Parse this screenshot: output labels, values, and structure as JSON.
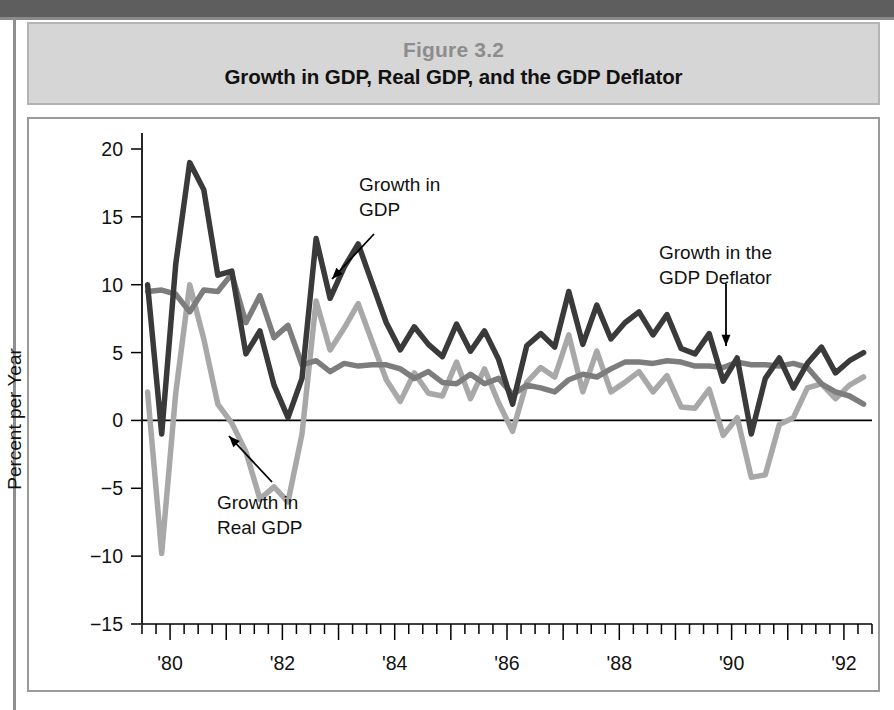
{
  "figure": {
    "number_label": "Figure 3.2",
    "title": "Growth in GDP, Real GDP, and the GDP Deflator"
  },
  "chart_data": {
    "type": "line",
    "title": "Growth in GDP, Real GDP, and the GDP Deflator",
    "xlabel": "",
    "ylabel": "Percent per Year",
    "ylim": [
      -15,
      20
    ],
    "xlim": [
      1979.5,
      1992.5
    ],
    "yticks": [
      20,
      15,
      10,
      5,
      0,
      -5,
      -10,
      -15
    ],
    "ytick_labels": [
      "20",
      "15",
      "10",
      "5",
      "0",
      "−5",
      "−10",
      "−15"
    ],
    "xticks": [
      1980,
      1982,
      1984,
      1986,
      1988,
      1990,
      1992
    ],
    "xtick_labels": [
      "'80",
      "'82",
      "'84",
      "'86",
      "'88",
      "'90",
      "'92"
    ],
    "minor_tick_interval_years": 0.25,
    "grid": false,
    "legend": "annotations",
    "annotations": [
      {
        "name": "growth-in-gdp",
        "text": "Growth in\nGDP",
        "lines": [
          "Growth in",
          "GDP"
        ],
        "series": "Growth in GDP"
      },
      {
        "name": "growth-in-real-gdp",
        "text": "Growth in\nReal GDP",
        "lines": [
          "Growth in",
          "Real GDP"
        ],
        "series": "Growth in Real GDP"
      },
      {
        "name": "growth-in-gdp-deflator",
        "text": "Growth in the\nGDP Deflator",
        "lines": [
          "Growth in the",
          "GDP Deflator"
        ],
        "series": "Growth in the GDP Deflator"
      }
    ],
    "x": [
      1979.6,
      1979.85,
      1980.1,
      1980.35,
      1980.6,
      1980.85,
      1981.1,
      1981.35,
      1981.6,
      1981.85,
      1982.1,
      1982.35,
      1982.6,
      1982.85,
      1983.1,
      1983.35,
      1983.6,
      1983.85,
      1984.1,
      1984.35,
      1984.6,
      1984.85,
      1985.1,
      1985.35,
      1985.6,
      1985.85,
      1986.1,
      1986.35,
      1986.6,
      1986.85,
      1987.1,
      1987.35,
      1987.6,
      1987.85,
      1988.1,
      1988.35,
      1988.6,
      1988.85,
      1989.1,
      1989.35,
      1989.6,
      1989.85,
      1990.1,
      1990.35,
      1990.6,
      1990.85,
      1991.1,
      1991.35,
      1991.6,
      1991.85,
      1992.1,
      1992.35
    ],
    "series": [
      {
        "name": "Growth in GDP",
        "color": "#3a3a3a",
        "width": 5.5,
        "values": [
          10.0,
          -1.0,
          11.5,
          19.0,
          17.0,
          10.7,
          11.0,
          4.9,
          6.6,
          2.6,
          0.2,
          3.1,
          13.4,
          9.0,
          11.3,
          13.0,
          10.1,
          7.2,
          5.2,
          6.9,
          5.6,
          4.7,
          7.1,
          5.1,
          6.6,
          4.5,
          1.2,
          5.5,
          6.4,
          5.4,
          9.5,
          5.6,
          8.5,
          6.0,
          7.2,
          8.0,
          6.3,
          7.8,
          5.3,
          4.9,
          6.4,
          2.9,
          4.6,
          -1.0,
          3.1,
          4.6,
          2.4,
          4.2,
          5.4,
          3.5,
          4.4,
          5.0
        ]
      },
      {
        "name": "Growth in the GDP Deflator",
        "color": "#7d7d7d",
        "width": 5.5,
        "values": [
          9.5,
          9.6,
          9.3,
          8.0,
          9.6,
          9.5,
          10.8,
          7.2,
          9.2,
          6.1,
          7.0,
          4.1,
          4.4,
          3.6,
          4.2,
          4.0,
          4.1,
          4.1,
          3.8,
          3.1,
          3.6,
          2.8,
          2.7,
          3.4,
          2.7,
          3.1,
          1.9,
          2.6,
          2.4,
          2.1,
          3.0,
          3.4,
          3.2,
          3.8,
          4.3,
          4.3,
          4.2,
          4.4,
          4.3,
          4.0,
          4.0,
          3.9,
          4.3,
          4.1,
          4.1,
          4.0,
          4.2,
          3.9,
          2.7,
          2.1,
          1.8,
          1.2
        ]
      },
      {
        "name": "Growth in Real GDP",
        "color": "#a8a8a8",
        "width": 5.5,
        "values": [
          2.1,
          -9.8,
          2.0,
          10.0,
          6.0,
          1.2,
          -0.2,
          -2.3,
          -5.8,
          -4.9,
          -6.0,
          -1.0,
          8.8,
          5.2,
          6.8,
          8.6,
          5.8,
          3.0,
          1.4,
          3.5,
          2.0,
          1.8,
          4.3,
          1.6,
          3.8,
          1.3,
          -0.8,
          2.8,
          3.9,
          3.2,
          6.3,
          2.1,
          5.1,
          2.1,
          2.8,
          3.6,
          2.1,
          3.3,
          1.0,
          0.9,
          2.3,
          -1.1,
          0.2,
          -4.2,
          -4.0,
          -0.3,
          0.2,
          2.4,
          2.7,
          1.6,
          2.6,
          3.2
        ]
      }
    ]
  }
}
